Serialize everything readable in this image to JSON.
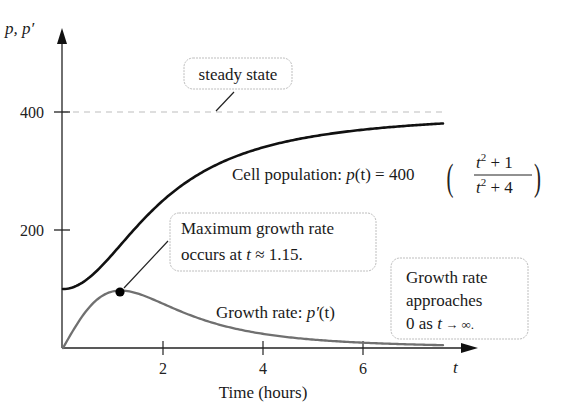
{
  "chart_data": {
    "type": "line",
    "title": "",
    "xlabel": "Time (hours)",
    "ylabel": "p, p′",
    "x_axis_var": "t",
    "xlim": [
      0,
      7.6
    ],
    "ylim": [
      0,
      430
    ],
    "x_ticks": [
      2,
      4,
      6
    ],
    "y_ticks": [
      200,
      400
    ],
    "grid": false,
    "series": [
      {
        "name": "Cell population: p(t) = 400((t^2 + 1)/(t^2 + 4))",
        "formula": "400*(t^2+1)/(t^2+4)",
        "color": "#111111",
        "x": [
          0,
          0.5,
          1,
          1.5,
          2,
          2.5,
          3,
          3.5,
          4,
          4.5,
          5,
          5.5,
          6,
          6.5,
          7,
          7.5
        ],
        "values": [
          100,
          123.5,
          160,
          200,
          250,
          281.5,
          307.7,
          327.4,
          340,
          350.6,
          358.6,
          364.7,
          370,
          373.4,
          376.6,
          378.8
        ]
      },
      {
        "name": "Growth rate: p′(t)",
        "formula": "2400*t/(t^2+4)^2",
        "color": "#6e6e6e",
        "x": [
          0,
          0.5,
          1,
          1.155,
          1.5,
          2,
          2.5,
          3,
          3.5,
          4,
          4.5,
          5,
          5.5,
          6,
          6.5,
          7,
          7.5
        ],
        "values": [
          0,
          66.5,
          96,
          97.4,
          92.2,
          75,
          57.6,
          42.6,
          31.2,
          24,
          18.3,
          14.3,
          11.3,
          9,
          7.4,
          6.1,
          5.1
        ]
      },
      {
        "name": "steady state",
        "style": "dashed",
        "color": "#b5b5b5",
        "x": [
          0,
          7.6
        ],
        "values": [
          400,
          400
        ]
      }
    ],
    "annotations": [
      {
        "text": "steady state",
        "points_to": {
          "t": 3,
          "y": 400
        }
      },
      {
        "text": "Cell population: p(t) = 400((t² + 1)/(t² + 4))"
      },
      {
        "text": "Maximum growth rate occurs at t ≈ 1.15.",
        "points_to": {
          "t": 1.15,
          "y": 97.4
        }
      },
      {
        "text": "Growth rate: p′(t)"
      },
      {
        "text": "Growth rate approaches 0 as t → ∞."
      }
    ],
    "marker": {
      "t": 1.15,
      "y": 97.4,
      "label": "maximum growth rate"
    }
  },
  "labels": {
    "y_axis": "p, p′",
    "x_axis_var": "t",
    "x_axis_title": "Time (hours)",
    "x_ticks": [
      "2",
      "4",
      "6"
    ],
    "y_ticks": [
      "400",
      "200"
    ],
    "steady_state": "steady state",
    "pop_prefix": "Cell population: ",
    "pop_p": "p",
    "pop_t": "(t)",
    "pop_eq": " = 400",
    "pop_num_t": "t",
    "pop_num_rest": " + 1",
    "pop_den_t": "t",
    "pop_den_rest": " + 4",
    "sup2": "2",
    "max_line1": "Maximum growth rate",
    "max_line2_a": "occurs at ",
    "max_line2_t": "t",
    "max_line2_b": " ≈ 1.15.",
    "rate_prefix": "Growth rate: ",
    "rate_p": "p′",
    "rate_t": "(t)",
    "approach_line1": "Growth rate",
    "approach_line2": "approaches",
    "approach_line3_a": "0 as ",
    "approach_line3_t": "t",
    "approach_line3_b": " → ∞."
  }
}
